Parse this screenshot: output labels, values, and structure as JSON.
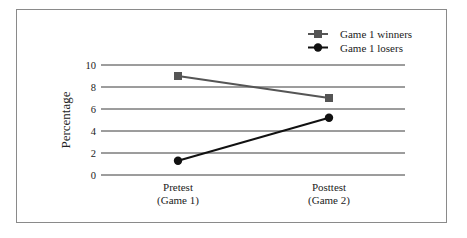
{
  "chart_data": {
    "type": "line",
    "title": "",
    "xlabel": "",
    "ylabel": "Percentage",
    "ylim": [
      0,
      10
    ],
    "yticks": [
      0,
      2,
      4,
      6,
      8,
      10
    ],
    "grid": true,
    "legend_position": "top-right",
    "categories": [
      "Pretest\n(Game 1)",
      "Posttest\n(Game 2)"
    ],
    "category_lines": [
      [
        "Pretest",
        "(Game 1)"
      ],
      [
        "Posttest",
        "(Game 2)"
      ]
    ],
    "series": [
      {
        "name": "Game 1 winners",
        "marker": "square",
        "color": "#555555",
        "values": [
          9.0,
          7.0
        ]
      },
      {
        "name": "Game 1 losers",
        "marker": "circle",
        "color": "#111111",
        "values": [
          1.3,
          5.2
        ]
      }
    ]
  }
}
